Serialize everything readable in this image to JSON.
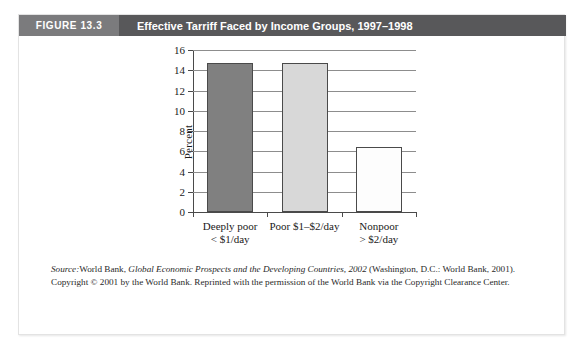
{
  "figure": {
    "number_label": "FIGURE 13.3",
    "title": "Effective Tarriff Faced by Income Groups, 1997–1998",
    "header_bg": "#58585a",
    "number_box_bg": "#7b7b7d"
  },
  "source": {
    "prefix": "Source:",
    "part1": "World Bank, ",
    "work_title": "Global Economic Prospects and the Developing Countries, 2002",
    "part2": " (Washington, D.C.: World Bank, 2001). Copyright © 2001 by the World Bank. Reprinted with the permission of the World Bank via the Copyright Clearance Center."
  },
  "chart_data": {
    "type": "bar",
    "title": "Effective Tarriff Faced by Income Groups, 1997–1998",
    "xlabel": "",
    "ylabel": "Percent",
    "ylim": [
      0,
      16
    ],
    "ytick_values": [
      0,
      2,
      4,
      6,
      8,
      10,
      12,
      14,
      16
    ],
    "ytick_labels": [
      "0",
      "2",
      "4",
      "6",
      "8",
      "10",
      "12",
      "14",
      "16"
    ],
    "grid": true,
    "legend": "none",
    "categories": [
      "Deeply poor < $1/day",
      "Poor $1–$2/day",
      "Nonpoor > $2/day"
    ],
    "category_lines": [
      [
        "Deeply poor",
        "< $1/day"
      ],
      [
        "Poor $1–$2/day",
        ""
      ],
      [
        "Nonpoor",
        "> $2/day"
      ]
    ],
    "values": [
      14.7,
      14.7,
      6.4
    ],
    "bar_colors": [
      "#808080",
      "#d8d8d8",
      "#fdfdfd"
    ],
    "bar_edge_color": "#4a4a4a"
  }
}
